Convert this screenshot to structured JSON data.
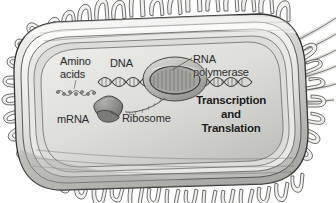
{
  "figure": {
    "background_color": "#ffffff",
    "width": 336,
    "height": 203
  },
  "labels": {
    "amino_acids": "Amino\nacids",
    "dna": "DNA",
    "rna_polymerase": "RNA\npolymerase",
    "mrna": "mRNA",
    "ribosome": "Ribosome",
    "process": "Transcription\nand\nTranslation"
  },
  "colors": {
    "outline": "#3a3a3a",
    "cytoplasm_light": "#dedeo",
    "cytoplasm": "#d8d8d4",
    "envelope": "#c9c9c4",
    "envelope_dark": "#9a9a95",
    "ribosome_fill": "#8e8e8a",
    "polymerase_fill": "#b5b5b0",
    "text": "#2b2b2b",
    "text_bold": "#1a1a1a"
  },
  "structures": {
    "cell": "rod-shaped bacterium with rounded ends",
    "envelope_layers": 4,
    "pili_count_top": 14,
    "pili_count_bottom": 16,
    "flagella_count": 6,
    "flagella_position": "upper-right",
    "dna_form": "double helix strand running horizontally",
    "polymerase_form": "large oval transcription bubble on DNA",
    "mrna_form": "strand curving from polymerase to ribosome",
    "amino_acid_chain": "beaded chain left of ribosome"
  }
}
